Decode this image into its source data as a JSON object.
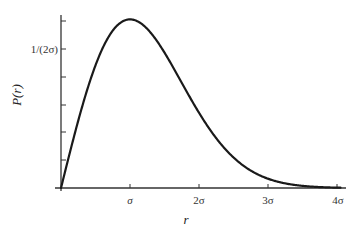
{
  "chart_data": {
    "type": "line",
    "title": "",
    "xlabel": "r",
    "ylabel": "P(r)",
    "function": "P(r) = (r/σ^2) exp(-r^2/(2σ^2))",
    "x_unit": "σ",
    "xlim": [
      0,
      4.1
    ],
    "ylim": [
      0,
      0.62
    ],
    "x_ticks": [
      1,
      2,
      3,
      4
    ],
    "x_tick_labels": [
      "σ",
      "2σ",
      "3σ",
      "4σ"
    ],
    "y_ticks": [
      0.1,
      0.2,
      0.3,
      0.4,
      0.5,
      0.6
    ],
    "y_tick_labels": [
      "",
      "",
      "",
      "",
      "1/(2σ)",
      ""
    ],
    "grid": false,
    "legend": null,
    "series": [
      {
        "name": "P(r)",
        "x": [
          0,
          0.25,
          0.5,
          0.75,
          1.0,
          1.25,
          1.5,
          1.75,
          2.0,
          2.25,
          2.5,
          2.75,
          3.0,
          3.25,
          3.5,
          3.75,
          4.0
        ],
        "values": [
          0,
          0.242,
          0.441,
          0.566,
          0.607,
          0.573,
          0.487,
          0.379,
          0.271,
          0.179,
          0.11,
          0.062,
          0.033,
          0.017,
          0.008,
          0.003,
          0.001
        ]
      }
    ],
    "peak": {
      "x": 1,
      "y": 0.607
    }
  },
  "labels": {
    "ylabel": "P(r)",
    "xlabel": "r",
    "ytick_half": "1/(2σ)",
    "xtick_1": "σ",
    "xtick_2": "2σ",
    "xtick_3": "3σ",
    "xtick_4": "4σ"
  },
  "style": {
    "axis_color": "#333333",
    "curve_color": "#1a1a1a"
  }
}
